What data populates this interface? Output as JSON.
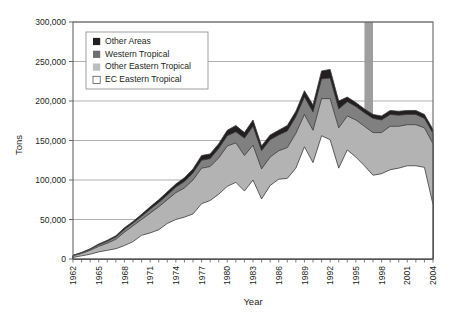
{
  "chart_data": {
    "type": "area",
    "stacked": true,
    "title": "",
    "xlabel": "Year",
    "ylabel": "Tons",
    "ylim": [
      0,
      300000
    ],
    "ytick_step": 50000,
    "ytick_labels": [
      "0",
      "50,000",
      "100,000",
      "150,000",
      "200,000",
      "250,000",
      "300,000"
    ],
    "ytick_values": [
      0,
      50000,
      100000,
      150000,
      200000,
      250000,
      300000
    ],
    "xlim": [
      1962,
      2004
    ],
    "xtick_label_step": 3,
    "xtick_labels": [
      "1962",
      "1965",
      "1968",
      "1971",
      "1974",
      "1977",
      "1980",
      "1983",
      "1986",
      "1989",
      "1992",
      "1995",
      "1998",
      "2001",
      "2004"
    ],
    "grid": "horizontal",
    "legend_position": "top-left-inside",
    "x": [
      1962,
      1963,
      1964,
      1965,
      1966,
      1967,
      1968,
      1969,
      1970,
      1971,
      1972,
      1973,
      1974,
      1975,
      1976,
      1977,
      1978,
      1979,
      1980,
      1981,
      1982,
      1983,
      1984,
      1985,
      1986,
      1987,
      1988,
      1989,
      1990,
      1991,
      1992,
      1993,
      1994,
      1995,
      1996,
      1997,
      1998,
      1999,
      2000,
      2001,
      2002,
      2003,
      2004
    ],
    "series": [
      {
        "name": "EC Eastern Tropical",
        "color": "#ffffff",
        "values": [
          2000,
          4000,
          6000,
          9000,
          11000,
          13000,
          17000,
          22000,
          30000,
          33000,
          37000,
          45000,
          50000,
          53000,
          57000,
          70000,
          74000,
          82000,
          92000,
          97000,
          86000,
          100000,
          76000,
          93000,
          101000,
          102000,
          115000,
          142000,
          122000,
          156000,
          151000,
          115000,
          138000,
          129000,
          118000,
          106000,
          108000,
          113000,
          115000,
          118000,
          118000,
          116000,
          69000
        ]
      },
      {
        "name": "Other Eastern Tropical",
        "color": "#b3b3b3",
        "values": [
          2000,
          3000,
          5000,
          7000,
          9000,
          12000,
          17000,
          20000,
          20000,
          25000,
          29000,
          30000,
          34000,
          37000,
          43000,
          45000,
          43000,
          46000,
          51000,
          50000,
          45000,
          44000,
          38000,
          36000,
          36000,
          39000,
          44000,
          41000,
          41000,
          47000,
          52000,
          51000,
          43000,
          47000,
          50000,
          54000,
          52000,
          55000,
          53000,
          52000,
          52000,
          50000,
          77000
        ]
      },
      {
        "name": "Western Tropical",
        "color": "#808080",
        "values": [
          500,
          800,
          1200,
          2000,
          2500,
          3000,
          3500,
          3500,
          4000,
          5000,
          5500,
          6000,
          7000,
          8000,
          9000,
          10000,
          10000,
          12000,
          13000,
          14000,
          22000,
          24000,
          23000,
          22000,
          20000,
          21000,
          21000,
          22000,
          23000,
          25000,
          26000,
          24000,
          18000,
          17000,
          17000,
          18000,
          16000,
          15000,
          14000,
          13000,
          13000,
          12000,
          13000
        ]
      },
      {
        "name": "Other Areas",
        "color": "#231f20",
        "values": [
          300,
          500,
          800,
          1000,
          1200,
          1500,
          2000,
          2000,
          2500,
          3000,
          3500,
          4000,
          4000,
          5000,
          5000,
          6000,
          6000,
          6000,
          7000,
          8000,
          7000,
          8000,
          6000,
          6000,
          6000,
          7000,
          7000,
          8000,
          9000,
          10000,
          11000,
          10000,
          6000,
          5000,
          5000,
          5000,
          5000,
          5000,
          5000,
          5000,
          5000,
          5000,
          5000
        ]
      }
    ],
    "highlight_band": {
      "start": 1996,
      "end": 1997,
      "color": "#999999"
    }
  },
  "legend": {
    "items": [
      {
        "label": "Other Areas",
        "swatch": "#231f20"
      },
      {
        "label": "Western Tropical",
        "swatch": "#6d6e71"
      },
      {
        "label": "Other Eastern Tropical",
        "swatch": "#bcbec0"
      },
      {
        "label": "EC Eastern Tropical",
        "swatch": "#ffffff"
      }
    ]
  },
  "axes": {
    "y_title": "Tons",
    "x_title": "Year"
  }
}
